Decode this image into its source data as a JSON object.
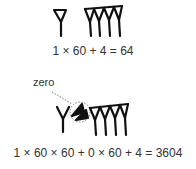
{
  "example1": {
    "equation": "1 × 60  +  4  = 64",
    "signs": [
      "one-sixty-wedge",
      "four-units-wedges"
    ]
  },
  "example2": {
    "label": "zero",
    "equation": "1 × 60 × 60 + 0 × 60 + 4 = 3604",
    "signs": [
      "one-sixty-squared-wedge",
      "zero-placeholder-wedge",
      "four-units-wedges"
    ]
  },
  "colors": {
    "ink": "#111111",
    "text": "#333333",
    "dotted": "#555555"
  }
}
